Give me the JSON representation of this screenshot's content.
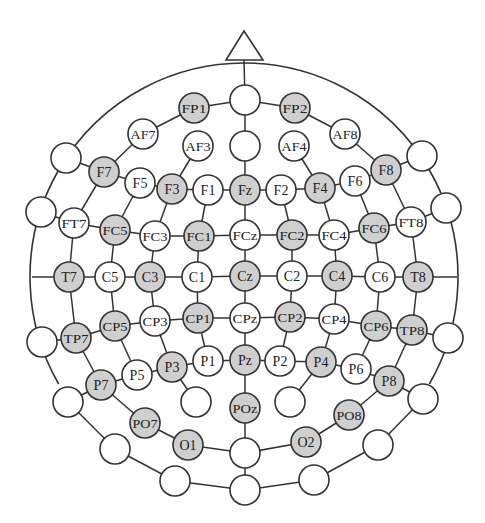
{
  "diagram": {
    "colors": {
      "background": "#ffffff",
      "stroke": "#333333",
      "selected_fill": "#cfcfcf",
      "unselected_fill": "#ffffff",
      "text": "#222222"
    },
    "head": {
      "cx": 244,
      "cy": 277,
      "r": 214
    },
    "nose": {
      "apex": [
        244,
        31
      ],
      "left": [
        226,
        60
      ],
      "right": [
        263,
        60
      ]
    },
    "electrode_radius": 15,
    "electrodes": [
      {
        "id": "Nz_top",
        "label": "",
        "x": 245,
        "y": 100,
        "selected": false
      },
      {
        "id": "FP1",
        "label": "FP1",
        "x": 194,
        "y": 108,
        "selected": true
      },
      {
        "id": "FP2",
        "label": "FP2",
        "x": 295,
        "y": 108,
        "selected": true
      },
      {
        "id": "AF7",
        "label": "AF7",
        "x": 143,
        "y": 134,
        "selected": false
      },
      {
        "id": "AF3",
        "label": "AF3",
        "x": 198,
        "y": 146,
        "selected": false
      },
      {
        "id": "AFz",
        "label": "",
        "x": 245,
        "y": 146,
        "selected": false
      },
      {
        "id": "AF4",
        "label": "AF4",
        "x": 294,
        "y": 146,
        "selected": false
      },
      {
        "id": "AF8",
        "label": "AF8",
        "x": 345,
        "y": 134,
        "selected": false
      },
      {
        "id": "L_F9",
        "label": "",
        "x": 66,
        "y": 158,
        "selected": false
      },
      {
        "id": "F7",
        "label": "F7",
        "x": 104,
        "y": 172,
        "selected": true
      },
      {
        "id": "F5",
        "label": "F5",
        "x": 140,
        "y": 183,
        "selected": false
      },
      {
        "id": "F3",
        "label": "F3",
        "x": 172,
        "y": 189,
        "selected": true
      },
      {
        "id": "F1",
        "label": "F1",
        "x": 208,
        "y": 190,
        "selected": false
      },
      {
        "id": "Fz",
        "label": "Fz",
        "x": 245,
        "y": 190,
        "selected": true
      },
      {
        "id": "F2",
        "label": "F2",
        "x": 281,
        "y": 190,
        "selected": false
      },
      {
        "id": "F4",
        "label": "F4",
        "x": 320,
        "y": 188,
        "selected": true
      },
      {
        "id": "F6",
        "label": "F6",
        "x": 355,
        "y": 181,
        "selected": false
      },
      {
        "id": "F8",
        "label": "F8",
        "x": 386,
        "y": 170,
        "selected": true
      },
      {
        "id": "R_F10",
        "label": "",
        "x": 422,
        "y": 156,
        "selected": false
      },
      {
        "id": "L_FT9",
        "label": "",
        "x": 41,
        "y": 212,
        "selected": false
      },
      {
        "id": "FT7",
        "label": "FT7",
        "x": 74,
        "y": 223,
        "selected": false
      },
      {
        "id": "FC5",
        "label": "FC5",
        "x": 115,
        "y": 230,
        "selected": true
      },
      {
        "id": "FC3",
        "label": "FC3",
        "x": 155,
        "y": 236,
        "selected": false
      },
      {
        "id": "FC1",
        "label": "FC1",
        "x": 199,
        "y": 236,
        "selected": true
      },
      {
        "id": "FCz",
        "label": "FCz",
        "x": 245,
        "y": 235,
        "selected": false
      },
      {
        "id": "FC2",
        "label": "FC2",
        "x": 292,
        "y": 235,
        "selected": true
      },
      {
        "id": "FC4",
        "label": "FC4",
        "x": 334,
        "y": 235,
        "selected": false
      },
      {
        "id": "FC6",
        "label": "FC6",
        "x": 374,
        "y": 228,
        "selected": true
      },
      {
        "id": "FT8",
        "label": "FT8",
        "x": 411,
        "y": 222,
        "selected": false
      },
      {
        "id": "R_FT10",
        "label": "",
        "x": 446,
        "y": 208,
        "selected": false
      },
      {
        "id": "T7",
        "label": "T7",
        "x": 69,
        "y": 277,
        "selected": true
      },
      {
        "id": "C5",
        "label": "C5",
        "x": 110,
        "y": 277,
        "selected": false
      },
      {
        "id": "C3",
        "label": "C3",
        "x": 150,
        "y": 277,
        "selected": true
      },
      {
        "id": "C1",
        "label": "C1",
        "x": 197,
        "y": 277,
        "selected": false
      },
      {
        "id": "Cz",
        "label": "Cz",
        "x": 245,
        "y": 276,
        "selected": true
      },
      {
        "id": "C2",
        "label": "C2",
        "x": 292,
        "y": 276,
        "selected": false
      },
      {
        "id": "C4",
        "label": "C4",
        "x": 337,
        "y": 276,
        "selected": true
      },
      {
        "id": "C6",
        "label": "C6",
        "x": 380,
        "y": 277,
        "selected": false
      },
      {
        "id": "T8",
        "label": "T8",
        "x": 418,
        "y": 277,
        "selected": true
      },
      {
        "id": "L_TP9",
        "label": "",
        "x": 42,
        "y": 342,
        "selected": false
      },
      {
        "id": "TP7",
        "label": "TP7",
        "x": 76,
        "y": 338,
        "selected": true
      },
      {
        "id": "CP5",
        "label": "CP5",
        "x": 115,
        "y": 326,
        "selected": true
      },
      {
        "id": "CP3",
        "label": "CP3",
        "x": 155,
        "y": 321,
        "selected": false
      },
      {
        "id": "CP1",
        "label": "CP1",
        "x": 198,
        "y": 318,
        "selected": true
      },
      {
        "id": "CPz",
        "label": "CPz",
        "x": 245,
        "y": 318,
        "selected": false
      },
      {
        "id": "CP2",
        "label": "CP2",
        "x": 290,
        "y": 317,
        "selected": true
      },
      {
        "id": "CP4",
        "label": "CP4",
        "x": 334,
        "y": 319,
        "selected": false
      },
      {
        "id": "CP6",
        "label": "CP6",
        "x": 376,
        "y": 326,
        "selected": true
      },
      {
        "id": "TP8",
        "label": "TP8",
        "x": 412,
        "y": 330,
        "selected": true
      },
      {
        "id": "R_TP10",
        "label": "",
        "x": 448,
        "y": 338,
        "selected": false
      },
      {
        "id": "P7",
        "label": "P7",
        "x": 101,
        "y": 385,
        "selected": true
      },
      {
        "id": "P5",
        "label": "P5",
        "x": 137,
        "y": 375,
        "selected": false
      },
      {
        "id": "P3",
        "label": "P3",
        "x": 172,
        "y": 367,
        "selected": true
      },
      {
        "id": "P1",
        "label": "P1",
        "x": 208,
        "y": 361,
        "selected": false
      },
      {
        "id": "Pz",
        "label": "Pz",
        "x": 245,
        "y": 360,
        "selected": true
      },
      {
        "id": "P2",
        "label": "P2",
        "x": 280,
        "y": 361,
        "selected": false
      },
      {
        "id": "P4",
        "label": "P4",
        "x": 321,
        "y": 362,
        "selected": true
      },
      {
        "id": "P6",
        "label": "P6",
        "x": 356,
        "y": 369,
        "selected": false
      },
      {
        "id": "P8",
        "label": "P8",
        "x": 389,
        "y": 381,
        "selected": true
      },
      {
        "id": "L_P9",
        "label": "",
        "x": 68,
        "y": 402,
        "selected": false
      },
      {
        "id": "R_P10",
        "label": "",
        "x": 423,
        "y": 399,
        "selected": false
      },
      {
        "id": "PO3",
        "label": "",
        "x": 196,
        "y": 402,
        "selected": false
      },
      {
        "id": "POz",
        "label": "POz",
        "x": 245,
        "y": 408,
        "selected": true
      },
      {
        "id": "PO4",
        "label": "",
        "x": 290,
        "y": 402,
        "selected": false
      },
      {
        "id": "PO7",
        "label": "PO7",
        "x": 145,
        "y": 423,
        "selected": true
      },
      {
        "id": "PO8",
        "label": "PO8",
        "x": 349,
        "y": 415,
        "selected": true
      },
      {
        "id": "O1",
        "label": "O1",
        "x": 188,
        "y": 445,
        "selected": true
      },
      {
        "id": "Oz",
        "label": "",
        "x": 245,
        "y": 453,
        "selected": false
      },
      {
        "id": "O2",
        "label": "O2",
        "x": 306,
        "y": 442,
        "selected": true
      },
      {
        "id": "L_PO9",
        "label": "",
        "x": 115,
        "y": 449,
        "selected": false
      },
      {
        "id": "R_PO10",
        "label": "",
        "x": 378,
        "y": 445,
        "selected": false
      },
      {
        "id": "L_O9",
        "label": "",
        "x": 175,
        "y": 481,
        "selected": false
      },
      {
        "id": "Iz",
        "label": "",
        "x": 245,
        "y": 490,
        "selected": false
      },
      {
        "id": "R_O10",
        "label": "",
        "x": 314,
        "y": 480,
        "selected": false
      }
    ],
    "connections": [
      [
        "Nz_top",
        "FP1"
      ],
      [
        "Nz_top",
        "FP2"
      ],
      [
        "FP1",
        "AF7"
      ],
      [
        "FP2",
        "AF8"
      ],
      [
        "AF7",
        "F7"
      ],
      [
        "AF8",
        "F8"
      ],
      [
        "Nz_top",
        "AFz"
      ],
      [
        "AFz",
        "Fz"
      ],
      [
        "AF3",
        "F3"
      ],
      [
        "AF4",
        "F4"
      ],
      [
        "L_F9",
        "F7"
      ],
      [
        "F7",
        "F5"
      ],
      [
        "F5",
        "F3"
      ],
      [
        "F3",
        "F1"
      ],
      [
        "F1",
        "Fz"
      ],
      [
        "Fz",
        "F2"
      ],
      [
        "F2",
        "F4"
      ],
      [
        "F4",
        "F6"
      ],
      [
        "F6",
        "F8"
      ],
      [
        "F8",
        "R_F10"
      ],
      [
        "L_FT9",
        "FT7"
      ],
      [
        "FT7",
        "FC5"
      ],
      [
        "FC5",
        "FC3"
      ],
      [
        "FC3",
        "FC1"
      ],
      [
        "FC1",
        "FCz"
      ],
      [
        "FCz",
        "FC2"
      ],
      [
        "FC2",
        "FC4"
      ],
      [
        "FC4",
        "FC6"
      ],
      [
        "FC6",
        "FT8"
      ],
      [
        "FT8",
        "R_FT10"
      ],
      [
        "T7",
        "C5"
      ],
      [
        "C5",
        "C3"
      ],
      [
        "C3",
        "C1"
      ],
      [
        "C1",
        "Cz"
      ],
      [
        "Cz",
        "C2"
      ],
      [
        "C2",
        "C4"
      ],
      [
        "C4",
        "C6"
      ],
      [
        "C6",
        "T8"
      ],
      [
        "L_TP9",
        "TP7"
      ],
      [
        "TP7",
        "CP5"
      ],
      [
        "CP5",
        "CP3"
      ],
      [
        "CP3",
        "CP1"
      ],
      [
        "CP1",
        "CPz"
      ],
      [
        "CPz",
        "CP2"
      ],
      [
        "CP2",
        "CP4"
      ],
      [
        "CP4",
        "CP6"
      ],
      [
        "CP6",
        "TP8"
      ],
      [
        "TP8",
        "R_TP10"
      ],
      [
        "L_P9",
        "P7"
      ],
      [
        "P7",
        "P5"
      ],
      [
        "P5",
        "P3"
      ],
      [
        "P3",
        "P1"
      ],
      [
        "P1",
        "Pz"
      ],
      [
        "Pz",
        "P2"
      ],
      [
        "P2",
        "P4"
      ],
      [
        "P4",
        "P6"
      ],
      [
        "P6",
        "P8"
      ],
      [
        "P8",
        "R_P10"
      ],
      [
        "F7",
        "FT7"
      ],
      [
        "FT7",
        "T7"
      ],
      [
        "T7",
        "TP7"
      ],
      [
        "TP7",
        "P7"
      ],
      [
        "P7",
        "PO7"
      ],
      [
        "PO7",
        "O1"
      ],
      [
        "O1",
        "Oz"
      ],
      [
        "F8",
        "FT8"
      ],
      [
        "FT8",
        "T8"
      ],
      [
        "T8",
        "TP8"
      ],
      [
        "TP8",
        "P8"
      ],
      [
        "P8",
        "PO8"
      ],
      [
        "PO8",
        "O2"
      ],
      [
        "O2",
        "Oz"
      ],
      [
        "F5",
        "FC5"
      ],
      [
        "FC5",
        "C5"
      ],
      [
        "C5",
        "CP5"
      ],
      [
        "CP5",
        "P5"
      ],
      [
        "F6",
        "FC6"
      ],
      [
        "FC6",
        "C6"
      ],
      [
        "C6",
        "CP6"
      ],
      [
        "CP6",
        "P6"
      ],
      [
        "F3",
        "FC3"
      ],
      [
        "FC3",
        "C3"
      ],
      [
        "C3",
        "CP3"
      ],
      [
        "CP3",
        "P3"
      ],
      [
        "P3",
        "PO3"
      ],
      [
        "F4",
        "FC4"
      ],
      [
        "FC4",
        "C4"
      ],
      [
        "C4",
        "CP4"
      ],
      [
        "CP4",
        "P4"
      ],
      [
        "P4",
        "PO4"
      ],
      [
        "F1",
        "FC1"
      ],
      [
        "FC1",
        "C1"
      ],
      [
        "C1",
        "CP1"
      ],
      [
        "CP1",
        "P1"
      ],
      [
        "F2",
        "FC2"
      ],
      [
        "FC2",
        "C2"
      ],
      [
        "C2",
        "CP2"
      ],
      [
        "CP2",
        "P2"
      ],
      [
        "Fz",
        "FCz"
      ],
      [
        "FCz",
        "Cz"
      ],
      [
        "Cz",
        "CPz"
      ],
      [
        "CPz",
        "Pz"
      ],
      [
        "Pz",
        "POz"
      ],
      [
        "POz",
        "Oz"
      ],
      [
        "Oz",
        "Iz"
      ],
      [
        "L_P9",
        "L_PO9"
      ],
      [
        "L_PO9",
        "L_O9"
      ],
      [
        "L_O9",
        "Iz"
      ],
      [
        "Iz",
        "R_O10"
      ],
      [
        "R_O10",
        "R_PO10"
      ],
      [
        "R_PO10",
        "R_P10"
      ]
    ],
    "spokes": [
      {
        "from": [
          244,
          60
        ],
        "to": "Nz_top"
      },
      {
        "from": [
          32,
          277
        ],
        "to": "T7"
      },
      {
        "from": [
          457,
          277
        ],
        "to": "T8"
      }
    ],
    "outer_arcs": [
      {
        "from": "L_F9",
        "to": "Nz_top_arc_top"
      },
      {
        "note": "head outline arcs between peripheral electrodes"
      }
    ]
  }
}
